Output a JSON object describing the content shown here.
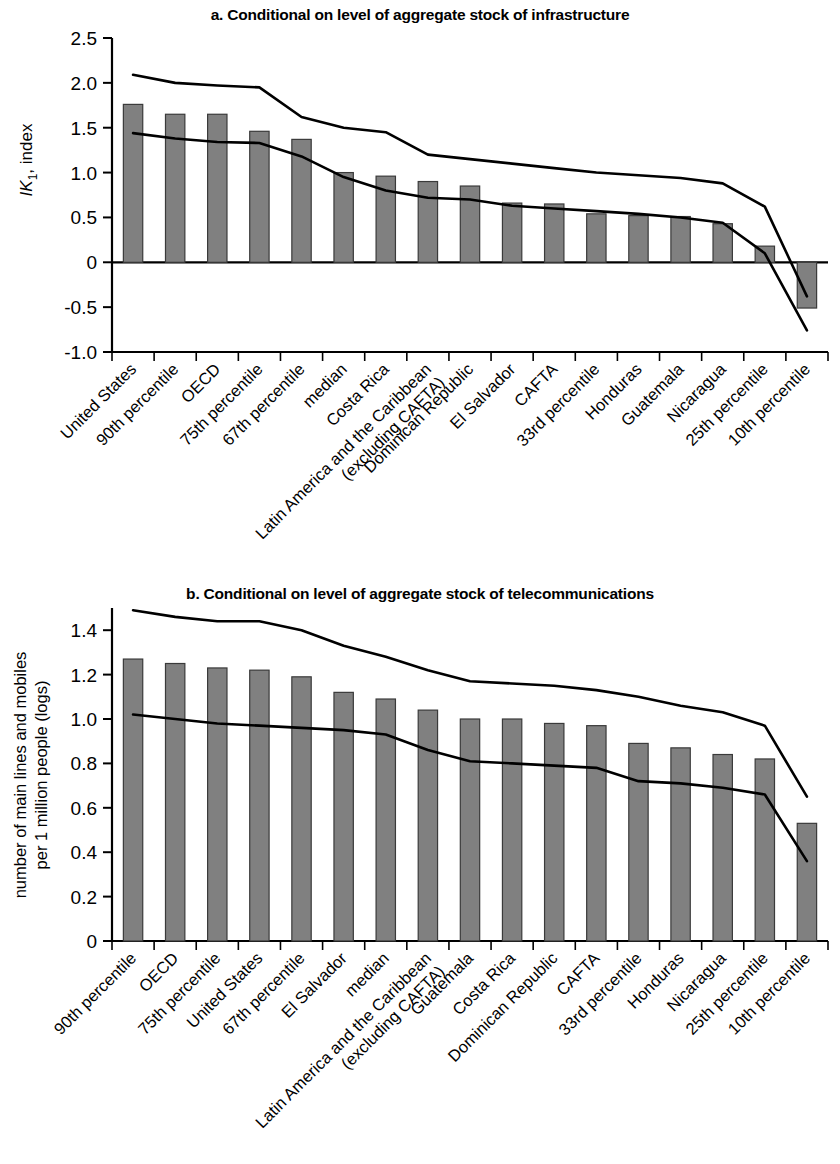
{
  "figure": {
    "background": "#ffffff",
    "bar_color": "#808080",
    "bar_edge_color": "#3a3a3a",
    "line_color": "#000000"
  },
  "panel_a": {
    "title": "a. Conditional on level of aggregate stock of infrastructure",
    "ylabel_main": "IK",
    "ylabel_sub": "1",
    "ylabel_tail": ", index"
  },
  "panel_b": {
    "title": "b. Conditional on level of aggregate stock of telecommunications",
    "ylabel_line1": "number of main lines and mobiles",
    "ylabel_line2": "per 1 million people (logs)"
  },
  "chart_data": [
    {
      "type": "bar",
      "id": "panel-a",
      "title": "a. Conditional on level of aggregate stock of infrastructure",
      "xlabel": "",
      "ylabel": "IK1, index",
      "ylim": [
        -1.0,
        2.5
      ],
      "ytick_values": [
        -1.0,
        -0.5,
        0,
        0.5,
        1.0,
        1.5,
        2.0,
        2.5
      ],
      "ytick_labels": [
        "-1.0",
        "-0.5",
        "0",
        "0.5",
        "1.0",
        "1.5",
        "2.0",
        "2.5"
      ],
      "grid": false,
      "legend": "none",
      "categories": [
        "United States",
        "90th percentile",
        "OECD",
        "75th percentile",
        "67th percentile",
        "median",
        "Costa Rica",
        "Latin America and the Caribbean (excluding CAFTA)",
        "Dominican Republic",
        "El Salvador",
        "CAFTA",
        "33rd percentile",
        "Honduras",
        "Guatemala",
        "Nicaragua",
        "25th percentile",
        "10th percentile"
      ],
      "values": [
        1.76,
        1.65,
        1.65,
        1.46,
        1.37,
        1.0,
        0.96,
        0.9,
        0.85,
        0.66,
        0.65,
        0.54,
        0.52,
        0.51,
        0.43,
        0.18,
        -0.51
      ],
      "series": [
        {
          "name": "upper confidence band",
          "type": "line",
          "values": [
            2.09,
            2.0,
            1.97,
            1.95,
            1.62,
            1.5,
            1.45,
            1.2,
            1.15,
            1.1,
            1.05,
            1.0,
            0.97,
            0.94,
            0.88,
            0.62,
            -0.38
          ]
        },
        {
          "name": "lower confidence band",
          "type": "line",
          "values": [
            1.44,
            1.38,
            1.34,
            1.33,
            1.18,
            0.95,
            0.8,
            0.72,
            0.7,
            0.63,
            0.6,
            0.57,
            0.54,
            0.5,
            0.44,
            0.1,
            -0.76
          ]
        }
      ]
    },
    {
      "type": "bar",
      "id": "panel-b",
      "title": "b. Conditional on level of aggregate stock of telecommunications",
      "xlabel": "",
      "ylabel": "number of main lines and mobiles per 1 million people (logs)",
      "ylim": [
        0,
        1.5
      ],
      "ytick_values": [
        0,
        0.2,
        0.4,
        0.6,
        0.8,
        1.0,
        1.2,
        1.4
      ],
      "ytick_labels": [
        "0",
        "0.2",
        "0.4",
        "0.6",
        "0.8",
        "1.0",
        "1.2",
        "1.4"
      ],
      "grid": false,
      "legend": "none",
      "categories": [
        "90th percentile",
        "OECD",
        "75th percentile",
        "United States",
        "67th percentile",
        "El Salvador",
        "median",
        "Latin America and the Caribbean (excluding CAFTA)",
        "Guatemala",
        "Costa Rica",
        "Dominican Republic",
        "CAFTA",
        "33rd percentile",
        "Honduras",
        "Nicaragua",
        "25th percentile",
        "10th percentile"
      ],
      "values": [
        1.27,
        1.25,
        1.23,
        1.22,
        1.19,
        1.12,
        1.09,
        1.04,
        1.0,
        1.0,
        0.98,
        0.97,
        0.89,
        0.87,
        0.84,
        0.82,
        0.53
      ],
      "series": [
        {
          "name": "upper confidence band",
          "type": "line",
          "values": [
            1.49,
            1.46,
            1.44,
            1.44,
            1.4,
            1.33,
            1.28,
            1.22,
            1.17,
            1.16,
            1.15,
            1.13,
            1.1,
            1.06,
            1.03,
            0.97,
            0.65
          ]
        },
        {
          "name": "lower confidence band",
          "type": "line",
          "values": [
            1.02,
            1.0,
            0.98,
            0.97,
            0.96,
            0.95,
            0.93,
            0.86,
            0.81,
            0.8,
            0.79,
            0.78,
            0.72,
            0.71,
            0.69,
            0.66,
            0.36
          ]
        }
      ]
    }
  ]
}
